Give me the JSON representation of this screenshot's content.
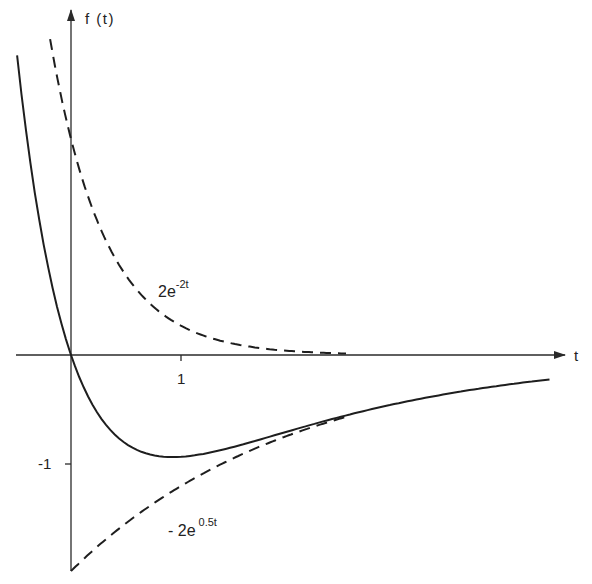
{
  "chart_data": {
    "type": "line",
    "title": "",
    "xlabel": "t",
    "ylabel": "f(t)",
    "xlim": [
      -0.5,
      4.45
    ],
    "ylim": [
      -2.0,
      3.2
    ],
    "grid": false,
    "x_ticks": [
      {
        "value": 1,
        "label": "1"
      }
    ],
    "y_ticks": [
      {
        "value": -1,
        "label": "-1"
      }
    ],
    "series": [
      {
        "name": "f(t) = 2e^{-2t} - 2e^{-0.5t}",
        "style": "solid",
        "label": "",
        "t_range": [
          -0.49,
          4.35
        ],
        "points": [
          {
            "t": -0.4,
            "f": 2.02
          },
          {
            "t": -0.2,
            "f": 0.77
          },
          {
            "t": 0.0,
            "f": 0.0
          },
          {
            "t": 0.25,
            "f": -0.55
          },
          {
            "t": 0.5,
            "f": -0.82
          },
          {
            "t": 0.75,
            "f": -0.93
          },
          {
            "t": 0.92,
            "f": -0.94
          },
          {
            "t": 1.0,
            "f": -0.94
          },
          {
            "t": 1.5,
            "f": -0.85
          },
          {
            "t": 2.0,
            "f": -0.7
          },
          {
            "t": 2.5,
            "f": -0.57
          },
          {
            "t": 3.0,
            "f": -0.44
          },
          {
            "t": 3.5,
            "f": -0.35
          },
          {
            "t": 4.0,
            "f": -0.27
          },
          {
            "t": 4.35,
            "f": -0.23
          }
        ]
      },
      {
        "name": "2e^{-2t}",
        "style": "dashed",
        "label_main": "2e",
        "label_sup": "-2t",
        "t_range": [
          -0.19,
          2.5
        ],
        "points": [
          {
            "t": -0.19,
            "f": 2.93
          },
          {
            "t": 0.0,
            "f": 2.0
          },
          {
            "t": 0.25,
            "f": 1.21
          },
          {
            "t": 0.5,
            "f": 0.74
          },
          {
            "t": 0.75,
            "f": 0.45
          },
          {
            "t": 1.0,
            "f": 0.27
          },
          {
            "t": 1.5,
            "f": 0.1
          },
          {
            "t": 2.0,
            "f": 0.04
          },
          {
            "t": 2.5,
            "f": 0.01
          }
        ]
      },
      {
        "name": "-2e^{-0.5t}",
        "style": "dashed",
        "label_main": "- 2e",
        "label_sup": "0.5t",
        "t_range": [
          0.0,
          2.5
        ],
        "points": [
          {
            "t": 0.0,
            "f": -2.0
          },
          {
            "t": 0.5,
            "f": -1.56
          },
          {
            "t": 1.0,
            "f": -1.21
          },
          {
            "t": 1.5,
            "f": -0.94
          },
          {
            "t": 2.0,
            "f": -0.74
          },
          {
            "t": 2.5,
            "f": -0.57
          }
        ]
      }
    ],
    "annotations": [
      {
        "text": "2e^{-2t}",
        "near": {
          "t": 1.05,
          "f": 0.65
        }
      },
      {
        "text": "-2e^{0.5t}",
        "near": {
          "t": 1.05,
          "f": -1.55
        }
      }
    ]
  },
  "axes": {
    "x_label": "t",
    "y_label": "f (t)",
    "x_tick_1": "1",
    "y_tick_neg1": "-1"
  },
  "labels": {
    "dashed_upper_main": "2e",
    "dashed_upper_sup": "-2t",
    "dashed_lower_main": "- 2e",
    "dashed_lower_sup": "0.5t"
  }
}
